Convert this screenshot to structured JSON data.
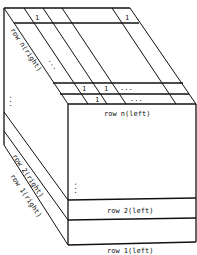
{
  "diagram": {
    "front_labels": {
      "row_n": "row n(left)",
      "row_2": "row 2(left)",
      "row_1": "row 1(left)"
    },
    "side_labels": {
      "row_n": "row n(right)",
      "row_2": "row 2(right)",
      "row_1": "row 1(right)"
    },
    "top_cells": {
      "top_row_cell_a": "1",
      "top_row_cell_b": "1",
      "mid_row_cell_a": "1",
      "mid_row_cell_b": "1",
      "mid_row_ellipsis": "...",
      "lower_row_cell": "1",
      "lower_row_ellipsis": "...",
      "top_face_ellipsis": "..."
    },
    "vertical_ellipsis": "⋮"
  }
}
